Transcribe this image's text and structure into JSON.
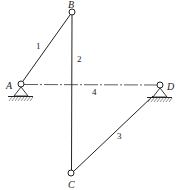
{
  "diagram": {
    "type": "four-bar linkage",
    "joints": [
      {
        "id": "A",
        "label": "A",
        "x": 21,
        "y": 84,
        "fixed": true
      },
      {
        "id": "B",
        "label": "B",
        "x": 72,
        "y": 12,
        "fixed": false
      },
      {
        "id": "C",
        "label": "C",
        "x": 71,
        "y": 173,
        "fixed": false
      },
      {
        "id": "D",
        "label": "D",
        "x": 160,
        "y": 85,
        "fixed": true
      }
    ],
    "links": [
      {
        "id": "1",
        "label": "1",
        "from": "A",
        "to": "B",
        "style": "solid"
      },
      {
        "id": "2",
        "label": "2",
        "from": "B",
        "to": "C",
        "style": "solid"
      },
      {
        "id": "3",
        "label": "3",
        "from": "C",
        "to": "D",
        "style": "solid"
      },
      {
        "id": "4",
        "label": "4",
        "from": "A",
        "to": "D",
        "style": "dash-dot"
      }
    ],
    "colors": {
      "line": "#222222",
      "background": "#ffffff"
    }
  }
}
